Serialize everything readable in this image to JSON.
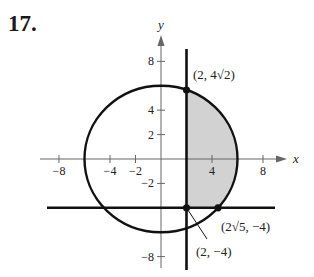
{
  "problem_number": "17.",
  "diagram": {
    "axes": {
      "x_label": "x",
      "y_label": "y",
      "x_ticks": [
        {
          "value": -8,
          "label": "−8"
        },
        {
          "value": -4,
          "label": "−4"
        },
        {
          "value": -2,
          "label": "−2"
        },
        {
          "value": 4,
          "label": "4"
        },
        {
          "value": 8,
          "label": "8"
        }
      ],
      "y_ticks": [
        {
          "value": 8,
          "label": "8"
        },
        {
          "value": 4,
          "label": "4"
        },
        {
          "value": 2,
          "label": "2"
        },
        {
          "value": -2,
          "label": "−2"
        },
        {
          "value": -8,
          "label": "−8"
        }
      ]
    },
    "circle": {
      "center": [
        0,
        0
      ],
      "radius": 6,
      "equation": "x^2 + y^2 = 36"
    },
    "vertical_line": {
      "x": 2,
      "y_range": [
        -9,
        9
      ]
    },
    "horizontal_line": {
      "y": -4,
      "x_range": [
        -9,
        9
      ]
    },
    "shaded_region": "bounded by x = 2, y = -4 and the circle (right side)",
    "colors": {
      "curve": "#111111",
      "shade": "#d2d2d2",
      "axis": "#666666"
    },
    "points": [
      {
        "x": 2,
        "y": 5.657,
        "label": "(2, 4√2)"
      },
      {
        "x": 4.472,
        "y": -4,
        "label": "(2√5, −4)"
      },
      {
        "x": 2,
        "y": -4,
        "label": "(2, −4)"
      }
    ]
  }
}
